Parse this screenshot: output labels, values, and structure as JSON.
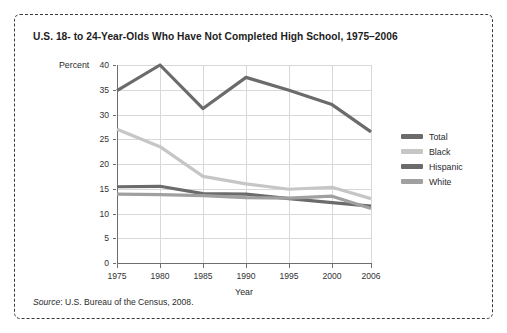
{
  "figure": {
    "title": "U.S. 18- to 24-Year-Olds Who Have Not Completed High School, 1975–2006",
    "source_word": "Source",
    "source_separator": ":",
    "source_text": "U.S. Bureau of the Census, 2008."
  },
  "legend": {
    "position": "right",
    "entries": [
      {
        "label": "Total",
        "color": "#6b6b6b"
      },
      {
        "label": "Black",
        "color": "#c6c6c6"
      },
      {
        "label": "Hispanic",
        "color": "#6b6b6b"
      },
      {
        "label": "White",
        "color": "#a0a0a0"
      }
    ]
  },
  "chart_data": {
    "type": "line",
    "title": "U.S. 18- to 24-Year-Olds Who Have Not Completed High School, 1975–2006",
    "xlabel": "Year",
    "ylabel": "Percent",
    "ylim": [
      0,
      40
    ],
    "yticks": [
      0,
      5,
      10,
      15,
      20,
      25,
      30,
      35,
      40
    ],
    "ytick_labels": [
      "0",
      "5",
      "10",
      "15",
      "20",
      "25",
      "30",
      "35",
      "40"
    ],
    "x": [
      1975,
      1980,
      1985,
      1990,
      1995,
      2000,
      2006
    ],
    "xtick_labels": [
      "1975",
      "1980",
      "1985",
      "1990",
      "1995",
      "2000",
      "2006"
    ],
    "xlim": [
      1975,
      2006
    ],
    "grid": true,
    "grid_axis": "both",
    "series": [
      {
        "name": "Total",
        "color": "#6b6b6b",
        "values": [
          34.8,
          40.0,
          31.2,
          37.5,
          34.9,
          32.0,
          26.5
        ]
      },
      {
        "name": "Black",
        "color": "#c6c6c6",
        "values": [
          27.0,
          23.5,
          17.5,
          16.0,
          14.9,
          15.3,
          13.0
        ]
      },
      {
        "name": "Hispanic",
        "color": "#6b6b6b",
        "values": [
          15.4,
          15.5,
          14.0,
          13.9,
          13.0,
          12.2,
          11.5
        ]
      },
      {
        "name": "White",
        "color": "#a0a0a0",
        "values": [
          13.9,
          13.8,
          13.6,
          13.2,
          13.1,
          13.5,
          11.0
        ]
      }
    ]
  }
}
